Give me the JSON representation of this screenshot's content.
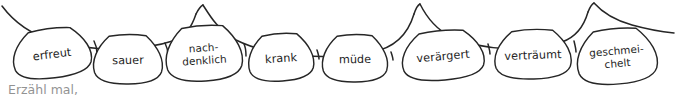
{
  "illustration": {
    "title": "Gefuehls-Girlande",
    "description": "Hand-drawn bunting garland with eight teardrop-shaped tags, each labelled with a German feeling word",
    "ink_color": "#262626",
    "text_color": "#1d1d1d",
    "background_color": "#ffffff",
    "tag_fill_color": "#ffffff"
  },
  "garland": {
    "tags": [
      {
        "id": "tag-erfreut",
        "lines": [
          "erfreut"
        ],
        "cx": 52,
        "cy": 54,
        "rx": 42,
        "ry": 24,
        "rotate": -7,
        "font_size": 11.2
      },
      {
        "id": "tag-sauer",
        "lines": [
          "sauer"
        ],
        "cx": 128,
        "cy": 60,
        "rx": 37,
        "ry": 24,
        "rotate": -1,
        "font_size": 11.2
      },
      {
        "id": "tag-nachdenklich",
        "lines": [
          "nach-",
          "denklich"
        ],
        "cx": 204,
        "cy": 54,
        "rx": 41,
        "ry": 27,
        "rotate": -4,
        "font_size": 10.4
      },
      {
        "id": "tag-krank",
        "lines": [
          "krank"
        ],
        "cx": 281,
        "cy": 58,
        "rx": 35,
        "ry": 23,
        "rotate": -4,
        "font_size": 11.2
      },
      {
        "id": "tag-muede",
        "lines": [
          "müde"
        ],
        "cx": 355,
        "cy": 59,
        "rx": 35,
        "ry": 23,
        "rotate": -1,
        "font_size": 11.2
      },
      {
        "id": "tag-veraergert",
        "lines": [
          "verärgert"
        ],
        "cx": 443,
        "cy": 56,
        "rx": 44,
        "ry": 24,
        "rotate": -5,
        "font_size": 11.2
      },
      {
        "id": "tag-vertraeumt",
        "lines": [
          "verträumt"
        ],
        "cx": 533,
        "cy": 55,
        "rx": 41,
        "ry": 24,
        "rotate": -2,
        "font_size": 11.2
      },
      {
        "id": "tag-geschmeichelt",
        "lines": [
          "geschmei-",
          "chelt"
        ],
        "cx": 617,
        "cy": 57,
        "rx": 43,
        "ry": 27,
        "rotate": -5,
        "font_size": 10.4
      }
    ],
    "string_description": "wavy ink line with raised peaks between groups of tags"
  },
  "caption": {
    "partial_text": "Erzähl mal,",
    "note": "text cropped at bottom edge of screenshot"
  }
}
